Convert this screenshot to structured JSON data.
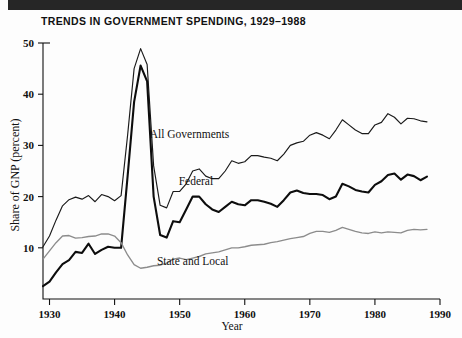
{
  "figure": {
    "title": "TRENDS IN GOVERNMENT SPENDING, 1929–1988",
    "topbar_color": "#262626",
    "background": "#fdfdfd"
  },
  "chart_data": {
    "type": "line",
    "title": "TRENDS IN GOVERNMENT SPENDING, 1929–1988",
    "xlabel": "Year",
    "ylabel": "Share of GNP (percent)",
    "xlim": [
      1929,
      1990
    ],
    "ylim": [
      0,
      50
    ],
    "xticks": [
      1930,
      1940,
      1950,
      1960,
      1970,
      1980,
      1990
    ],
    "xticklabels": [
      "1930",
      "1940",
      "1950",
      "1960",
      "1970",
      "1980",
      "1990"
    ],
    "yticks": [
      10,
      20,
      30,
      40,
      50
    ],
    "yticklabels": [
      "10",
      "20",
      "30",
      "40",
      "50"
    ],
    "grid": false,
    "legend_position": "inline-annotations",
    "x": [
      1929,
      1930,
      1931,
      1932,
      1933,
      1934,
      1935,
      1936,
      1937,
      1938,
      1939,
      1940,
      1941,
      1942,
      1943,
      1944,
      1945,
      1946,
      1947,
      1948,
      1949,
      1950,
      1951,
      1952,
      1953,
      1954,
      1955,
      1956,
      1957,
      1958,
      1959,
      1960,
      1961,
      1962,
      1963,
      1964,
      1965,
      1966,
      1967,
      1968,
      1969,
      1970,
      1971,
      1972,
      1973,
      1974,
      1975,
      1976,
      1977,
      1978,
      1979,
      1980,
      1981,
      1982,
      1983,
      1984,
      1985,
      1986,
      1987,
      1988
    ],
    "series": [
      {
        "name": "All Governments",
        "color": "#1a1a1a",
        "linewidth": 1.15,
        "label_xy": [
          1951.5,
          31.5
        ],
        "values": [
          10.2,
          12.3,
          15.4,
          18.2,
          19.4,
          19.9,
          19.5,
          20.2,
          19.0,
          20.4,
          20.0,
          19.2,
          20.2,
          32.0,
          45.0,
          48.9,
          45.8,
          26.0,
          18.3,
          17.8,
          21.0,
          21.0,
          22.5,
          25.0,
          25.4,
          24.0,
          23.5,
          23.5,
          25.0,
          27.0,
          26.5,
          26.8,
          28.0,
          28.0,
          27.7,
          27.5,
          27.0,
          28.3,
          30.0,
          30.5,
          30.8,
          32.0,
          32.5,
          32.0,
          31.3,
          33.0,
          35.0,
          34.0,
          33.0,
          32.3,
          32.3,
          34.0,
          34.5,
          36.2,
          35.5,
          34.2,
          35.3,
          35.2,
          34.8,
          34.6
        ]
      },
      {
        "name": "Federal",
        "color": "#0d0d0d",
        "linewidth": 2.1,
        "label_xy": [
          1952.5,
          22.3
        ],
        "values": [
          2.5,
          3.4,
          5.2,
          6.8,
          7.6,
          9.2,
          9.0,
          10.8,
          8.8,
          9.6,
          10.2,
          10.0,
          10.0,
          24.0,
          38.5,
          45.6,
          42.5,
          20.0,
          12.5,
          12.0,
          15.2,
          15.0,
          17.5,
          20.0,
          20.0,
          18.5,
          17.5,
          17.0,
          18.0,
          19.0,
          18.5,
          18.3,
          19.3,
          19.3,
          19.0,
          18.6,
          18.0,
          19.3,
          20.8,
          21.2,
          20.7,
          20.5,
          20.5,
          20.3,
          19.5,
          20.0,
          22.5,
          22.0,
          21.3,
          21.0,
          20.8,
          22.3,
          23.0,
          24.2,
          24.5,
          23.3,
          24.3,
          24.0,
          23.2,
          23.9
        ]
      },
      {
        "name": "State and Local",
        "color": "#8c8c8c",
        "linewidth": 1.35,
        "label_xy": [
          1952.0,
          6.6
        ],
        "values": [
          7.8,
          9.4,
          11.0,
          12.3,
          12.4,
          11.9,
          12.0,
          12.2,
          12.3,
          12.7,
          12.7,
          12.3,
          11.0,
          8.6,
          6.7,
          6.0,
          6.2,
          6.5,
          6.6,
          7.0,
          7.8,
          8.0,
          7.7,
          8.0,
          8.3,
          8.8,
          9.0,
          9.2,
          9.6,
          10.0,
          10.0,
          10.2,
          10.5,
          10.6,
          10.7,
          11.0,
          11.2,
          11.5,
          11.8,
          12.0,
          12.2,
          12.8,
          13.2,
          13.2,
          13.0,
          13.4,
          14.0,
          13.6,
          13.2,
          12.9,
          12.8,
          13.1,
          12.9,
          13.1,
          13.0,
          12.9,
          13.4,
          13.6,
          13.5,
          13.6
        ]
      }
    ]
  }
}
